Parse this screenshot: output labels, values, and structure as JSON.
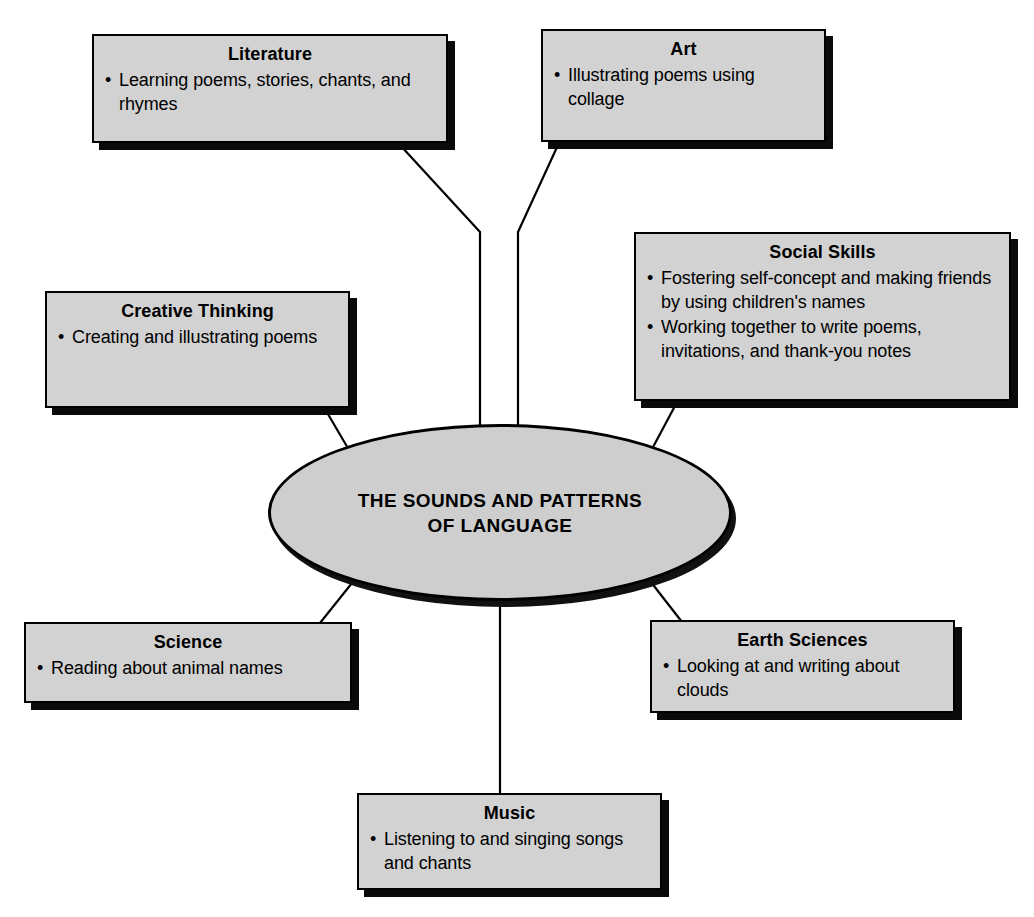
{
  "diagram": {
    "type": "concept-web",
    "center": {
      "label": "THE SOUNDS AND PATTERNS OF LANGUAGE",
      "line1": "THE SOUNDS AND PATTERNS",
      "line2": "OF LANGUAGE"
    },
    "nodes": [
      {
        "id": "literature",
        "title": "Literature",
        "bullets": [
          "Learning poems, stories, chants, and rhymes"
        ]
      },
      {
        "id": "art",
        "title": "Art",
        "bullets": [
          "Illustrating poems using collage"
        ]
      },
      {
        "id": "social-skills",
        "title": "Social Skills",
        "bullets": [
          "Fostering self-concept and making friends by using children's names",
          "Working together to write poems, invitations, and thank-you notes"
        ]
      },
      {
        "id": "creative-thinking",
        "title": "Creative Thinking",
        "bullets": [
          "Creating and illustrating poems"
        ]
      },
      {
        "id": "science",
        "title": "Science",
        "bullets": [
          "Reading about animal names"
        ]
      },
      {
        "id": "earth-sciences",
        "title": "Earth Sciences",
        "bullets": [
          "Looking at and writing about clouds"
        ]
      },
      {
        "id": "music",
        "title": "Music",
        "bullets": [
          "Listening to and singing songs and chants"
        ]
      }
    ],
    "colors": {
      "box_fill": "#d2d2d2",
      "ellipse_fill": "#cecece",
      "outline": "#000000",
      "shadow": "#0a0a0a",
      "background": "#ffffff"
    }
  }
}
